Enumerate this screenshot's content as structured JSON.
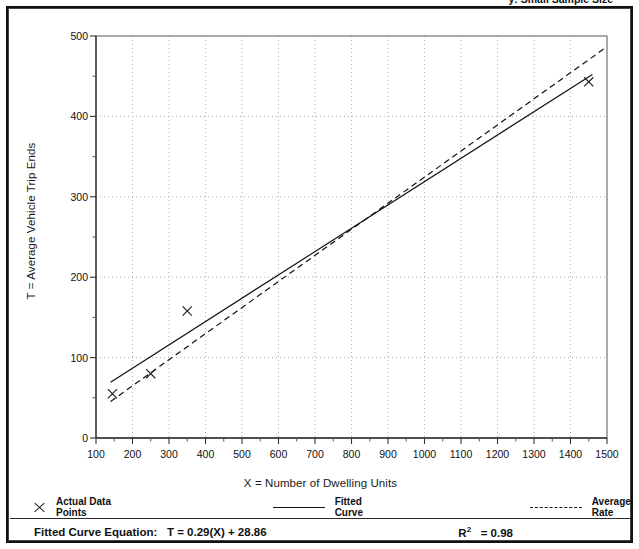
{
  "caption": {
    "left": "",
    "right": "y:  Small Sample Size"
  },
  "chart_data": {
    "type": "scatter",
    "title": "",
    "xlabel": "X = Number of Dwelling Units",
    "ylabel": "T = Average Vehicle Trip Ends",
    "xlim": [
      100,
      1500
    ],
    "ylim": [
      0,
      500
    ],
    "xticks": [
      100,
      200,
      300,
      400,
      500,
      600,
      700,
      800,
      900,
      1000,
      1100,
      1200,
      1300,
      1400,
      1500
    ],
    "yticks": [
      0,
      100,
      200,
      300,
      400,
      500
    ],
    "xtick_labels": [
      "100",
      "200",
      "300",
      "400",
      "500",
      "600",
      "700",
      "800",
      "900",
      "1000",
      "1100",
      "1200",
      "1300",
      "1400",
      "1500"
    ],
    "ytick_labels": [
      "0",
      "100",
      "200",
      "300",
      "400",
      "500"
    ],
    "grid": "dotted-major",
    "legend_position": "below-axes",
    "series": [
      {
        "name": "Actual Data Points",
        "type": "scatter",
        "marker": "x",
        "color": "#222222",
        "points": [
          {
            "x": 145,
            "y": 55
          },
          {
            "x": 250,
            "y": 80
          },
          {
            "x": 350,
            "y": 158
          },
          {
            "x": 1450,
            "y": 443
          }
        ]
      },
      {
        "name": "Fitted Curve",
        "type": "line",
        "style": "solid",
        "color": "#111111",
        "equation": "T = 0.29(X) + 28.86",
        "slope": 0.29,
        "intercept": 28.86,
        "x_range": [
          140,
          1460
        ]
      },
      {
        "name": "Average Rate",
        "type": "line",
        "style": "dashed",
        "color": "#111111",
        "slope": 0.3245,
        "intercept": 0,
        "x_range": [
          140,
          1500
        ]
      }
    ],
    "annotations": {
      "equation_label": "Fitted Curve Equation:",
      "equation_value": "T = 0.29(X) + 28.86",
      "r2_label": "R",
      "r2_exponent": "2",
      "r2_value": "= 0.98"
    }
  },
  "legend": {
    "items": [
      {
        "label": "Actual Data Points",
        "swatch": "marker"
      },
      {
        "label": "Fitted Curve",
        "swatch": "solid"
      },
      {
        "label": "Average Rate",
        "swatch": "dashed"
      }
    ]
  }
}
